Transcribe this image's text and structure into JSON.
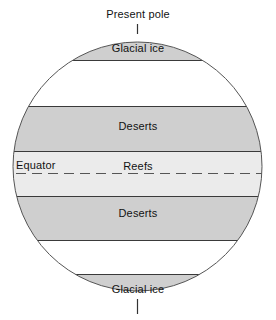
{
  "diagram": {
    "type": "zonal-climate-belt-globe",
    "title": "Present pole",
    "background_color": "#ffffff",
    "globe": {
      "outline_color": "#555555",
      "fill_color": "#ffffff",
      "center_x": 137.5,
      "center_y": 166.5,
      "radius": 124.5
    },
    "pole_axis": {
      "top_line": {
        "x": 137.5,
        "y1": 24,
        "y2": 34
      },
      "bottom_line": {
        "x": 137.5,
        "y1": 299,
        "y2": 314
      },
      "color": "#333333"
    },
    "palette": {
      "band_gray": "#cfcfcf",
      "band_light_gray": "#ebebeb",
      "band_white": "#ffffff",
      "line_dark": "#3a3a3a",
      "text": "#121212"
    },
    "bands": [
      {
        "id": "glacial-ice-north",
        "label": "Glacial ice",
        "fill": "#cfcfcf",
        "y_top": 33,
        "y_bottom": 60,
        "label_x": 137.5,
        "label_y": 42
      },
      {
        "id": "temperate-north",
        "label": "",
        "fill": "#ffffff",
        "y_top": 60,
        "y_bottom": 106
      },
      {
        "id": "deserts-north",
        "label": "Deserts",
        "fill": "#cfcfcf",
        "y_top": 106,
        "y_bottom": 151,
        "label_x": 137.5,
        "label_y": 120
      },
      {
        "id": "reefs-equatorial",
        "label": "Reefs",
        "fill": "#ebebeb",
        "y_top": 151,
        "y_bottom": 196,
        "label_x": 137.5,
        "label_y": 160
      },
      {
        "id": "deserts-south",
        "label": "Deserts",
        "fill": "#cfcfcf",
        "y_top": 196,
        "y_bottom": 240,
        "label_x": 137.5,
        "label_y": 207
      },
      {
        "id": "temperate-south",
        "label": "",
        "fill": "#ffffff",
        "y_top": 240,
        "y_bottom": 274
      },
      {
        "id": "glacial-ice-south",
        "label": "Glacial ice",
        "fill": "#cfcfcf",
        "y_top": 274,
        "y_bottom": 300,
        "label_x": 137.5,
        "label_y": 283
      }
    ],
    "equator": {
      "label": "Equator",
      "label_x": 16,
      "label_y": 159,
      "line_y": 173,
      "line_style": "dashed",
      "dash_pattern": "10 6",
      "color": "#555555"
    }
  }
}
